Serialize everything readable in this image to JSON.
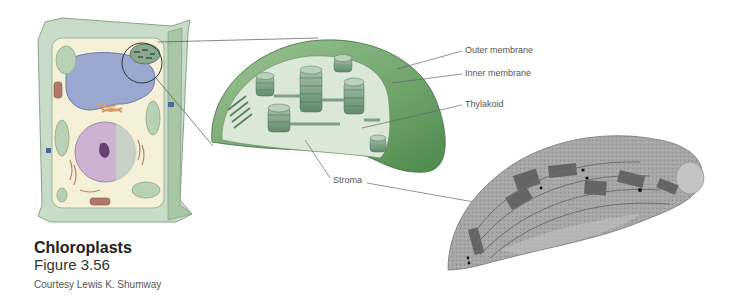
{
  "caption": {
    "title": "Chloroplasts",
    "figure": "Figure 3.56",
    "credit": "Courtesy Lewis K. Shumway"
  },
  "labels": {
    "outer_membrane": "Outer membrane",
    "inner_membrane": "Inner membrane",
    "thylakoid": "Thylakoid",
    "stroma": "Stroma"
  },
  "colors": {
    "cell_wall": "#c9dcc9",
    "cytoplasm": "#f4f1d8",
    "vacuole": "#9aa8d0",
    "nucleus": "#cdb3d3",
    "chloroplast_outer": "#6ea36a",
    "chloroplast_inner": "#d9e6d6",
    "grana": "#7fa58a",
    "micrograph": "#8a8a8a"
  }
}
